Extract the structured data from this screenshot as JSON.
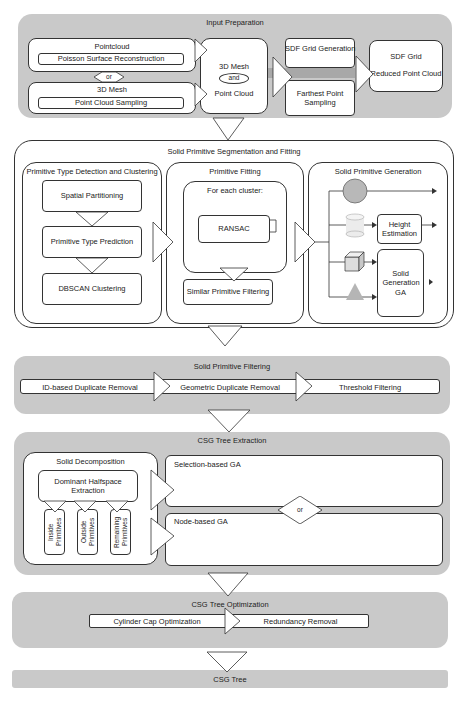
{
  "stages": {
    "input_preparation": {
      "title": "Input Preparation",
      "pointcloud": "Pointcloud",
      "poisson": "Poisson Surface Reconstruction",
      "or": "or",
      "mesh": "3D Mesh",
      "sampling": "Point Cloud Sampling",
      "mesh_and_pc_top": "3D Mesh",
      "and": "and",
      "mesh_and_pc_bottom": "Point Cloud",
      "sdf_generation": "SDF Grid Generation",
      "farthest_sampling": "Farthest Point Sampling",
      "sdf_grid": "SDF Grid",
      "reduced_pc": "Reduced Point Cloud"
    },
    "segmentation_fitting": {
      "title": "Solid Primitive Segmentation and Fitting",
      "detection": {
        "title": "Primitive Type Detection and Clustering",
        "steps": [
          "Spatial Partitioning",
          "Primitive Type Prediction",
          "DBSCAN Clustering"
        ]
      },
      "fitting": {
        "title": "Primitive Fitting",
        "loop_label": "For each cluster:",
        "ransac": "RANSAC",
        "similar_filtering": "Similar Primitive Filtering"
      },
      "generation": {
        "title": "Solid Primitive Generation",
        "shapes": [
          "sphere",
          "cylinder",
          "cube",
          "pyramid"
        ],
        "height_estimation": "Height Estimation",
        "solid_generation_ga": "Solid Generation GA"
      }
    },
    "filtering": {
      "title": "Solid Primitive Filtering",
      "steps": [
        "ID-based Duplicate Removal",
        "Geometric Duplicate Removal",
        "Threshold Filtering"
      ]
    },
    "extraction": {
      "title": "CSG Tree Extraction",
      "decomposition": {
        "title": "Solid Decomposition",
        "dominant": "Dominant Halfspace Extraction",
        "outputs": [
          "Inside Primitives",
          "Outside Primitives",
          "Remaining Primitives"
        ]
      },
      "selection_ga": "Selection-based GA",
      "or": "or",
      "node_ga": "Node-based GA"
    },
    "optimization": {
      "title": "CSG Tree Optimization",
      "steps": [
        "Cylinder Cap Optimization",
        "Redundancy Removal"
      ]
    },
    "output": {
      "title": "CSG Tree"
    }
  },
  "colors": {
    "panel": "#c9c9c9",
    "box": "#ffffff",
    "stroke": "#333333",
    "shape": "#bdbdbd"
  }
}
